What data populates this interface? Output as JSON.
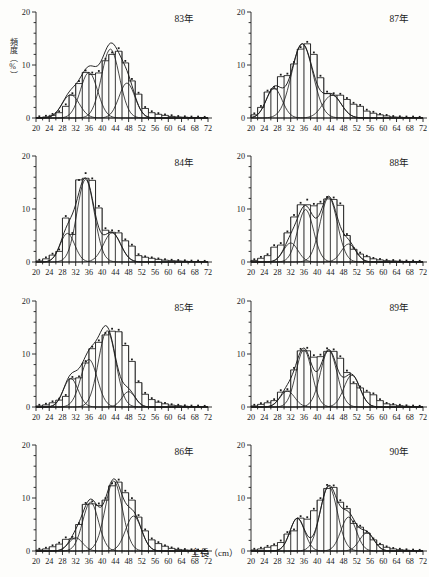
{
  "figure": {
    "y_axis_label": "頻度（%）",
    "x_axis_label": "全長（cm）",
    "caption": "",
    "axis": {
      "x_min": 20,
      "x_max": 72,
      "x_tick_step": 2,
      "x_label_step": 4,
      "x_tick_labels": [
        20,
        24,
        28,
        32,
        36,
        40,
        44,
        48,
        52,
        56,
        60,
        64,
        68,
        72
      ],
      "y_min": 0,
      "y_max": 20,
      "y_tick_step": 2,
      "y_label_step": 10,
      "y_tick_labels": [
        0,
        10,
        20
      ]
    },
    "ink_color": "#1b1b1b",
    "paper_color": "#fdfdfb"
  },
  "chart_data": [
    {
      "type": "bar",
      "title": "83年",
      "xlabel": "全長（cm）",
      "ylabel": "頻度（%）",
      "xlim": [
        20,
        72
      ],
      "ylim": [
        0,
        20
      ],
      "grid": false,
      "legend": "none",
      "bin_width": 2,
      "categories": [
        20,
        22,
        24,
        26,
        28,
        30,
        32,
        34,
        36,
        38,
        40,
        42,
        44,
        46,
        48,
        50,
        52,
        54,
        56,
        58,
        60,
        62,
        64,
        66,
        68,
        70
      ],
      "values": [
        0.1,
        0.2,
        0.5,
        1.0,
        2.2,
        4.3,
        6.5,
        8.6,
        8.2,
        8.5,
        10.8,
        12.0,
        12.6,
        10.4,
        7.0,
        4.5,
        1.8,
        1.0,
        0.7,
        0.5,
        0.3,
        0.2,
        0.15,
        0.1,
        0.1,
        0.05
      ],
      "markers": [
        0.15,
        0.25,
        0.6,
        1.1,
        2.4,
        4.5,
        6.8,
        8.8,
        8.4,
        8.7,
        11.0,
        12.2,
        13.0,
        10.6,
        7.2,
        4.6,
        1.9,
        1.1,
        0.75,
        0.5,
        0.35,
        0.2,
        0.15,
        0.1,
        0.1,
        0.05
      ],
      "components": [
        {
          "name": "component-1",
          "mean": 30.5,
          "sd": 2.6,
          "amplitude": 4.4
        },
        {
          "name": "component-2",
          "mean": 36.0,
          "sd": 2.6,
          "amplitude": 8.6
        },
        {
          "name": "component-3",
          "mean": 42.5,
          "sd": 2.7,
          "amplitude": 13.0
        },
        {
          "name": "component-4",
          "mean": 47.5,
          "sd": 2.4,
          "amplitude": 6.6
        }
      ]
    },
    {
      "type": "bar",
      "title": "87年",
      "xlabel": "全長（cm）",
      "ylabel": "頻度（%）",
      "xlim": [
        20,
        72
      ],
      "ylim": [
        0,
        20
      ],
      "grid": false,
      "legend": "none",
      "bin_width": 2,
      "categories": [
        20,
        22,
        24,
        26,
        28,
        30,
        32,
        34,
        36,
        38,
        40,
        42,
        44,
        46,
        48,
        50,
        52,
        54,
        56,
        58,
        60,
        62,
        64,
        66,
        68,
        70
      ],
      "values": [
        0.6,
        2.0,
        4.9,
        5.5,
        7.8,
        8.0,
        10.2,
        13.0,
        14.0,
        12.0,
        7.6,
        4.6,
        4.3,
        4.3,
        3.5,
        2.6,
        2.2,
        1.3,
        0.9,
        0.6,
        0.4,
        0.2,
        0.15,
        0.1,
        0.1,
        0.05
      ],
      "markers": [
        0.7,
        2.1,
        5.0,
        5.7,
        8.0,
        8.2,
        10.4,
        13.2,
        14.2,
        12.2,
        7.8,
        4.8,
        4.5,
        4.4,
        3.6,
        2.7,
        2.3,
        1.4,
        1.0,
        0.6,
        0.4,
        0.2,
        0.15,
        0.1,
        0.1,
        0.05
      ],
      "components": [
        {
          "name": "component-1",
          "mean": 27.0,
          "sd": 2.4,
          "amplitude": 5.6
        },
        {
          "name": "component-2",
          "mean": 35.5,
          "sd": 3.2,
          "amplitude": 14.0
        },
        {
          "name": "component-3",
          "mean": 44.5,
          "sd": 2.8,
          "amplitude": 4.3
        }
      ]
    },
    {
      "type": "bar",
      "title": "84年",
      "xlabel": "全長（cm）",
      "ylabel": "頻度（%）",
      "xlim": [
        20,
        72
      ],
      "ylim": [
        0,
        20
      ],
      "grid": false,
      "legend": "none",
      "bin_width": 2,
      "categories": [
        20,
        22,
        24,
        26,
        28,
        30,
        32,
        34,
        36,
        38,
        40,
        42,
        44,
        46,
        48,
        50,
        52,
        54,
        56,
        58,
        60,
        62,
        64,
        66,
        68,
        70
      ],
      "values": [
        0.2,
        0.6,
        1.3,
        2.0,
        8.3,
        5.2,
        15.5,
        15.8,
        15.4,
        10.2,
        6.0,
        5.6,
        5.5,
        4.0,
        3.0,
        1.2,
        0.9,
        0.7,
        0.5,
        0.35,
        0.25,
        0.2,
        0.15,
        0.1,
        0.1,
        0.05
      ],
      "markers": [
        0.25,
        0.7,
        1.4,
        2.2,
        8.5,
        5.3,
        15.3,
        16.6,
        15.6,
        10.4,
        6.2,
        5.8,
        5.7,
        4.1,
        3.1,
        1.3,
        0.9,
        0.7,
        0.5,
        0.35,
        0.25,
        0.2,
        0.15,
        0.1,
        0.1,
        0.05
      ],
      "components": [
        {
          "name": "component-1",
          "mean": 29.5,
          "sd": 2.2,
          "amplitude": 5.4
        },
        {
          "name": "component-2",
          "mean": 35.0,
          "sd": 2.6,
          "amplitude": 15.6
        },
        {
          "name": "component-3",
          "mean": 43.0,
          "sd": 2.6,
          "amplitude": 5.5
        }
      ]
    },
    {
      "type": "bar",
      "title": "88年",
      "xlabel": "全長（cm）",
      "ylabel": "頻度（%）",
      "xlim": [
        20,
        72
      ],
      "ylim": [
        0,
        20
      ],
      "grid": false,
      "legend": "none",
      "bin_width": 2,
      "categories": [
        20,
        22,
        24,
        26,
        28,
        30,
        32,
        34,
        36,
        38,
        40,
        42,
        44,
        46,
        48,
        50,
        52,
        54,
        56,
        58,
        60,
        62,
        64,
        66,
        68,
        70
      ],
      "values": [
        0.3,
        0.7,
        1.2,
        2.8,
        3.2,
        5.5,
        8.5,
        10.8,
        10.8,
        10.6,
        11.0,
        11.9,
        11.8,
        10.7,
        5.0,
        2.4,
        1.5,
        1.0,
        0.6,
        0.4,
        0.25,
        0.2,
        0.15,
        0.1,
        0.1,
        0.05
      ],
      "markers": [
        0.35,
        0.8,
        1.3,
        3.0,
        3.4,
        5.6,
        8.7,
        11.0,
        11.6,
        10.8,
        11.2,
        12.1,
        12.0,
        10.9,
        5.1,
        2.5,
        1.6,
        1.0,
        0.6,
        0.4,
        0.25,
        0.2,
        0.15,
        0.1,
        0.1,
        0.05
      ],
      "components": [
        {
          "name": "component-1",
          "mean": 32.0,
          "sd": 2.2,
          "amplitude": 3.6
        },
        {
          "name": "component-2",
          "mean": 36.5,
          "sd": 2.4,
          "amplitude": 9.9
        },
        {
          "name": "component-3",
          "mean": 43.5,
          "sd": 2.6,
          "amplitude": 12.2
        },
        {
          "name": "component-4",
          "mean": 49.5,
          "sd": 2.2,
          "amplitude": 3.4
        }
      ]
    },
    {
      "type": "bar",
      "title": "85年",
      "xlabel": "全長（cm）",
      "ylabel": "頻度（%）",
      "xlim": [
        20,
        72
      ],
      "ylim": [
        0,
        20
      ],
      "grid": false,
      "legend": "none",
      "bin_width": 2,
      "categories": [
        20,
        22,
        24,
        26,
        28,
        30,
        32,
        34,
        36,
        38,
        40,
        42,
        44,
        46,
        48,
        50,
        52,
        54,
        56,
        58,
        60,
        62,
        64,
        66,
        68,
        70
      ],
      "values": [
        0.2,
        0.4,
        0.8,
        1.3,
        2.0,
        5.3,
        5.5,
        8.3,
        11.0,
        12.2,
        13.6,
        14.3,
        14.2,
        11.6,
        8.6,
        4.6,
        2.4,
        1.4,
        0.9,
        0.6,
        0.35,
        0.25,
        0.15,
        0.1,
        0.1,
        0.05
      ],
      "markers": [
        0.25,
        0.45,
        0.9,
        1.4,
        2.1,
        5.5,
        5.6,
        8.5,
        11.2,
        12.4,
        13.8,
        14.6,
        14.4,
        11.8,
        8.8,
        4.7,
        2.5,
        1.5,
        0.9,
        0.6,
        0.35,
        0.25,
        0.15,
        0.1,
        0.1,
        0.05
      ],
      "components": [
        {
          "name": "component-1",
          "mean": 30.5,
          "sd": 2.2,
          "amplitude": 5.4
        },
        {
          "name": "component-2",
          "mean": 36.0,
          "sd": 2.5,
          "amplitude": 9.0
        },
        {
          "name": "component-3",
          "mean": 41.5,
          "sd": 2.6,
          "amplitude": 14.4
        },
        {
          "name": "component-4",
          "mean": 48.0,
          "sd": 2.0,
          "amplitude": 2.9
        }
      ]
    },
    {
      "type": "bar",
      "title": "89年",
      "xlabel": "全長（cm）",
      "ylabel": "頻度（%）",
      "xlim": [
        20,
        72
      ],
      "ylim": [
        0,
        20
      ],
      "grid": false,
      "legend": "none",
      "bin_width": 2,
      "categories": [
        20,
        22,
        24,
        26,
        28,
        30,
        32,
        34,
        36,
        38,
        40,
        42,
        44,
        46,
        48,
        50,
        52,
        54,
        56,
        58,
        60,
        62,
        64,
        66,
        68,
        70
      ],
      "values": [
        0.2,
        0.5,
        0.8,
        1.2,
        2.8,
        3.0,
        7.0,
        10.6,
        10.6,
        9.4,
        9.5,
        10.5,
        10.5,
        9.2,
        6.5,
        4.4,
        3.6,
        2.8,
        2.3,
        1.2,
        0.6,
        0.4,
        0.25,
        0.15,
        0.1,
        0.05
      ],
      "markers": [
        0.25,
        0.55,
        0.9,
        1.3,
        3.0,
        3.2,
        7.2,
        10.8,
        11.0,
        9.6,
        9.7,
        10.9,
        10.7,
        9.4,
        6.7,
        4.5,
        3.7,
        2.9,
        2.4,
        1.3,
        0.6,
        0.4,
        0.25,
        0.15,
        0.1,
        0.05
      ],
      "components": [
        {
          "name": "component-1",
          "mean": 31.0,
          "sd": 2.2,
          "amplitude": 3.0
        },
        {
          "name": "component-2",
          "mean": 36.0,
          "sd": 2.4,
          "amplitude": 10.8
        },
        {
          "name": "component-3",
          "mean": 43.5,
          "sd": 2.5,
          "amplitude": 10.7
        },
        {
          "name": "component-4",
          "mean": 50.5,
          "sd": 2.4,
          "amplitude": 6.0
        }
      ]
    },
    {
      "type": "bar",
      "title": "86年",
      "xlabel": "全長（cm）",
      "ylabel": "頻度（%）",
      "xlim": [
        20,
        72
      ],
      "ylim": [
        0,
        20
      ],
      "grid": false,
      "legend": "none",
      "bin_width": 2,
      "categories": [
        20,
        22,
        24,
        26,
        28,
        30,
        32,
        34,
        36,
        38,
        40,
        42,
        44,
        46,
        48,
        50,
        52,
        54,
        56,
        58,
        60,
        62,
        64,
        66,
        68,
        70
      ],
      "values": [
        0.2,
        0.4,
        0.8,
        1.3,
        2.2,
        2.3,
        5.0,
        8.8,
        8.9,
        8.6,
        9.6,
        12.3,
        13.0,
        11.0,
        9.6,
        6.4,
        3.8,
        2.1,
        1.4,
        0.9,
        0.5,
        0.3,
        0.2,
        0.15,
        0.1,
        0.05
      ],
      "markers": [
        0.25,
        0.45,
        0.9,
        1.4,
        2.4,
        2.5,
        5.1,
        8.9,
        9.2,
        8.8,
        9.8,
        12.6,
        13.3,
        11.2,
        9.8,
        6.6,
        3.9,
        2.2,
        1.5,
        0.9,
        0.5,
        0.3,
        0.2,
        0.15,
        0.1,
        0.05
      ],
      "components": [
        {
          "name": "component-1",
          "mean": 32.0,
          "sd": 2.1,
          "amplitude": 2.5
        },
        {
          "name": "component-2",
          "mean": 36.5,
          "sd": 2.4,
          "amplitude": 9.2
        },
        {
          "name": "component-3",
          "mean": 43.5,
          "sd": 2.6,
          "amplitude": 13.2
        },
        {
          "name": "component-4",
          "mean": 49.5,
          "sd": 2.4,
          "amplitude": 6.6
        }
      ]
    },
    {
      "type": "bar",
      "title": "90年",
      "xlabel": "全長（cm）",
      "ylabel": "頻度（%）",
      "xlim": [
        20,
        72
      ],
      "ylim": [
        0,
        20
      ],
      "grid": false,
      "legend": "none",
      "bin_width": 2,
      "categories": [
        20,
        22,
        24,
        26,
        28,
        30,
        32,
        34,
        36,
        38,
        40,
        42,
        44,
        46,
        48,
        50,
        52,
        54,
        56,
        58,
        60,
        62,
        64,
        66,
        68,
        70
      ],
      "values": [
        0.2,
        0.4,
        0.7,
        1.0,
        1.6,
        3.2,
        3.8,
        6.2,
        6.0,
        7.6,
        9.6,
        11.8,
        12.0,
        9.2,
        8.0,
        5.2,
        4.5,
        3.4,
        2.1,
        1.2,
        0.7,
        0.4,
        0.25,
        0.15,
        0.1,
        0.05
      ],
      "markers": [
        0.25,
        0.45,
        0.8,
        1.1,
        1.8,
        3.4,
        3.9,
        6.4,
        6.2,
        7.8,
        9.8,
        12.3,
        12.2,
        9.4,
        8.2,
        5.4,
        4.6,
        3.5,
        2.2,
        1.2,
        0.7,
        0.4,
        0.25,
        0.15,
        0.1,
        0.05
      ],
      "components": [
        {
          "name": "component-1",
          "mean": 34.0,
          "sd": 2.2,
          "amplitude": 6.2
        },
        {
          "name": "component-2",
          "mean": 43.5,
          "sd": 2.6,
          "amplitude": 12.2
        },
        {
          "name": "component-3",
          "mean": 49.5,
          "sd": 2.3,
          "amplitude": 6.4
        },
        {
          "name": "component-4",
          "mean": 55.0,
          "sd": 2.2,
          "amplitude": 3.4
        }
      ]
    }
  ]
}
